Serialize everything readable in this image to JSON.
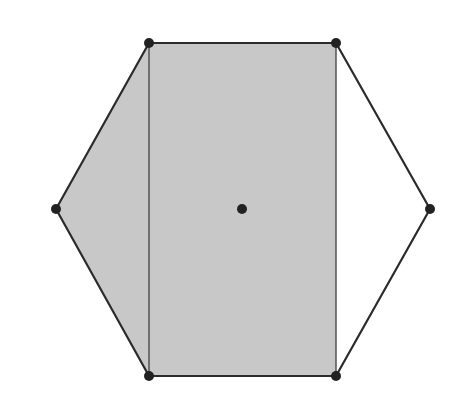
{
  "diagram": {
    "type": "hexagon-with-shaded-region",
    "colors": {
      "background": "#ffffff",
      "shade": "#c8c8c8",
      "stroke": "#2b2b2b",
      "point": "#222222"
    },
    "vertices": [
      {
        "name": "top-left",
        "x": 149,
        "y": 43
      },
      {
        "name": "top-right",
        "x": 336,
        "y": 43
      },
      {
        "name": "right",
        "x": 430,
        "y": 209
      },
      {
        "name": "bottom-right",
        "x": 336,
        "y": 376
      },
      {
        "name": "bottom-left",
        "x": 149,
        "y": 376
      },
      {
        "name": "left",
        "x": 56,
        "y": 209
      }
    ],
    "center": {
      "x": 242,
      "y": 209
    },
    "shaded_region": "left triangle + central rectangle",
    "inner_segment": {
      "from": "top-left",
      "to": "bottom-left"
    }
  }
}
